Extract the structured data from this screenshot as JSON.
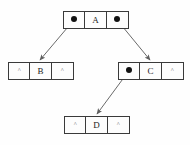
{
  "diagram": {
    "background_color": "#fefefe",
    "line_color": "#6a6a6a",
    "box_border_color": "#3a3a3a",
    "pointer_dot_color": "#111111",
    "null_symbol": "^",
    "nodes": [
      {
        "id": "node-a",
        "label": "A",
        "left": "pointer",
        "right": "pointer",
        "x": 63,
        "y": 11,
        "cells": [
          "",
          "A",
          ""
        ]
      },
      {
        "id": "node-b",
        "label": "B",
        "left": "null",
        "right": "null",
        "x": 8,
        "y": 62,
        "cells": [
          "^",
          "B",
          "^"
        ]
      },
      {
        "id": "node-c",
        "label": "C",
        "left": "pointer",
        "right": "null",
        "x": 118,
        "y": 62,
        "cells": [
          "",
          "C",
          "^"
        ]
      },
      {
        "id": "node-d",
        "label": "D",
        "left": "null",
        "right": "null",
        "x": 64,
        "y": 116,
        "cells": [
          "^",
          "D",
          "^"
        ]
      }
    ],
    "edges": [
      {
        "id": "edge-a-left-to-b",
        "from": "node-a-left-pointer",
        "to": "node-b",
        "x1": 73,
        "y1": 21,
        "x2": 39.5,
        "y2": 60.5
      },
      {
        "id": "edge-a-right-to-c",
        "from": "node-a-right-pointer",
        "to": "node-c",
        "x1": 118,
        "y1": 21,
        "x2": 150.5,
        "y2": 60.5
      },
      {
        "id": "edge-c-left-to-d",
        "from": "node-c-left-pointer",
        "to": "node-d",
        "x1": 128,
        "y1": 72,
        "x2": 96.5,
        "y2": 114.5
      }
    ]
  }
}
